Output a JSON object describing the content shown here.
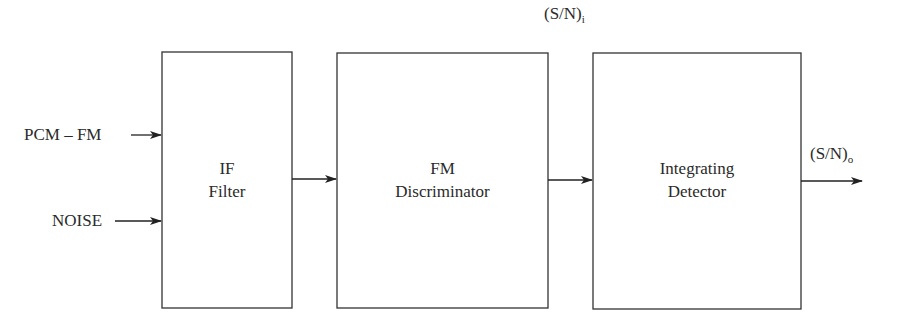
{
  "diagram": {
    "type": "block-diagram",
    "inputs": [
      {
        "id": "pcm-fm",
        "label": "PCM – FM"
      },
      {
        "id": "noise",
        "label": "NOISE"
      }
    ],
    "blocks": [
      {
        "id": "if-filter",
        "line1": "IF",
        "line2": "Filter"
      },
      {
        "id": "fm-discriminator",
        "line1": "FM",
        "line2": "Discriminator"
      },
      {
        "id": "integrating-detector",
        "line1": "Integrating",
        "line2": "Detector"
      }
    ],
    "signals": {
      "snr_in": {
        "main": "(S/N)",
        "sub": "i"
      },
      "snr_out": {
        "main": "(S/N)",
        "sub": "o"
      }
    },
    "connections": [
      {
        "from": "pcm-fm",
        "to": "if-filter"
      },
      {
        "from": "noise",
        "to": "if-filter"
      },
      {
        "from": "if-filter",
        "to": "fm-discriminator"
      },
      {
        "from": "fm-discriminator",
        "to": "integrating-detector"
      },
      {
        "from": "integrating-detector",
        "to": "output"
      }
    ],
    "colors": {
      "line": "#333333",
      "text": "#2a2a2a",
      "background": "#ffffff"
    }
  }
}
